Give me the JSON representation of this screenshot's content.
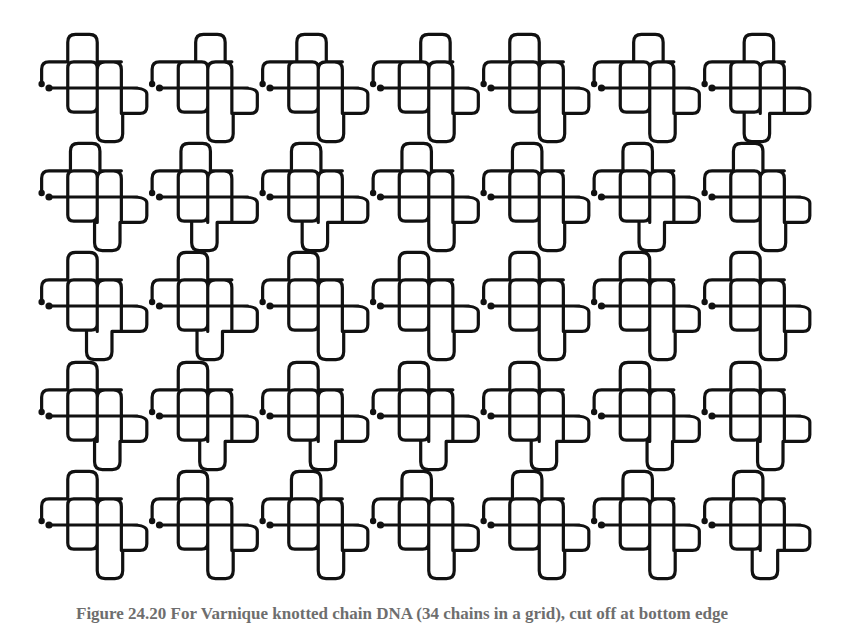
{
  "figure": {
    "type": "knot-diagram-grid",
    "rows": 5,
    "cols": 7,
    "stroke_color": "#111111",
    "background": "#ffffff",
    "unit_px": 13.4,
    "col_origin_x": [
      49,
      159.5,
      270,
      380.5,
      491,
      601.5,
      712
    ],
    "row_origin_y": [
      88,
      197,
      306,
      416,
      525
    ],
    "cells": [
      [
        {
          "top": 1.4,
          "bottom": 3.6
        },
        {
          "top": 2.7,
          "bottom": 3.6
        },
        {
          "top": 2.0,
          "bottom": 3.6
        },
        {
          "top": 3.0,
          "bottom": 3.6
        },
        {
          "top": 1.4,
          "bottom": 3.6
        },
        {
          "top": 2.4,
          "bottom": 3.6
        },
        {
          "top": 2.4,
          "bottom": 2.4
        }
      ],
      [
        {
          "top": 1.6,
          "bottom": 3.4
        },
        {
          "top": 1.6,
          "bottom": 2.4
        },
        {
          "top": 1.6,
          "bottom": 2.4
        },
        {
          "top": 1.6,
          "bottom": 3.6
        },
        {
          "top": 1.6,
          "bottom": 3.6
        },
        {
          "top": 1.6,
          "bottom": 2.8
        },
        {
          "top": 1.6,
          "bottom": 3.6
        }
      ],
      [
        {
          "top": 1.4,
          "bottom": 2.8
        },
        {
          "top": 1.4,
          "bottom": 2.8
        },
        {
          "top": 1.4,
          "bottom": 3.6
        },
        {
          "top": 1.4,
          "bottom": 3.6
        },
        {
          "top": 1.4,
          "bottom": 3.6
        },
        {
          "top": 1.4,
          "bottom": 3.6
        },
        {
          "top": 1.4,
          "bottom": 3.6
        }
      ],
      [
        {
          "top": 1.4,
          "bottom": 3.4
        },
        {
          "top": 1.4,
          "bottom": 3.0
        },
        {
          "top": 1.4,
          "bottom": 3.0
        },
        {
          "top": 1.4,
          "bottom": 3.0
        },
        {
          "top": 1.4,
          "bottom": 3.0
        },
        {
          "top": 1.4,
          "bottom": 3.4
        },
        {
          "top": 1.4,
          "bottom": 3.4
        }
      ],
      [
        {
          "top": 1.4,
          "bottom": 3.6
        },
        {
          "top": 1.4,
          "bottom": 3.6
        },
        {
          "top": 1.6,
          "bottom": 3.6
        },
        {
          "top": 1.6,
          "bottom": 3.6
        },
        {
          "top": 1.6,
          "bottom": 3.6
        },
        {
          "top": 1.6,
          "bottom": 3.6
        },
        {
          "top": 1.6,
          "bottom": 3.0
        }
      ]
    ]
  },
  "caption": {
    "text": "Figure 24.20    For Varnique knotted chain DNA (34 chains in a grid), cut off at bottom edge"
  }
}
